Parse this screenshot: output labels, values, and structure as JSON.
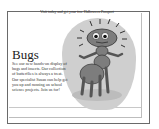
{
  "header": {
    "top_line": "Visit today and get your free Halloween Passport"
  },
  "article": {
    "title": "Bugs",
    "body": "See our new hands-on display of bugs and insects. Our collection of butterflies is always a treat. Our specialist Susan can help get you up and running on school science projects. Join us for!"
  },
  "illustration": {
    "subject": "cartoon-ant",
    "blob_color": "#cfcfcf",
    "bug_color": "#7d7d7d"
  }
}
